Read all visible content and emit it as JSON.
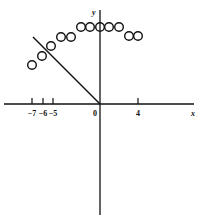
{
  "chart_data": {
    "type": "scatter",
    "title": "",
    "xlabel": "x",
    "ylabel": "y",
    "x_ticks": [
      {
        "value": -7,
        "label": "-7",
        "px": 32
      },
      {
        "value": -6,
        "label": "-6",
        "px": 43
      },
      {
        "value": -5,
        "label": "-5",
        "px": 53
      },
      {
        "value": 4,
        "label": "4",
        "px": 138
      }
    ],
    "origin_label": "0",
    "grid": false,
    "points_px": [
      [
        32,
        65
      ],
      [
        42,
        56
      ],
      [
        51,
        46
      ],
      [
        61,
        37
      ],
      [
        71,
        37
      ],
      [
        81,
        27
      ],
      [
        90,
        27
      ],
      [
        100,
        27
      ],
      [
        109,
        27
      ],
      [
        119,
        27
      ],
      [
        129,
        36
      ],
      [
        138,
        36
      ]
    ],
    "points_approx": [
      {
        "x": -6.6,
        "y": 3.8
      },
      {
        "x": -5.6,
        "y": 4.7
      },
      {
        "x": -4.7,
        "y": 5.6
      },
      {
        "x": -3.8,
        "y": 6.5
      },
      {
        "x": -2.8,
        "y": 6.5
      },
      {
        "x": -1.9,
        "y": 7.5
      },
      {
        "x": -1.0,
        "y": 7.5
      },
      {
        "x": 0,
        "y": 7.5
      },
      {
        "x": 1.0,
        "y": 7.5
      },
      {
        "x": 1.9,
        "y": 7.5
      },
      {
        "x": 2.8,
        "y": 6.6
      },
      {
        "x": 3.7,
        "y": 6.6
      }
    ],
    "line_segment_px": {
      "x1": 33,
      "y1": 37,
      "x2": 100,
      "y2": 104
    },
    "line_segment": {
      "description": "line from origin toward upper-left",
      "from": [
        0,
        0
      ],
      "to": [
        -6.5,
        6.5
      ]
    }
  }
}
